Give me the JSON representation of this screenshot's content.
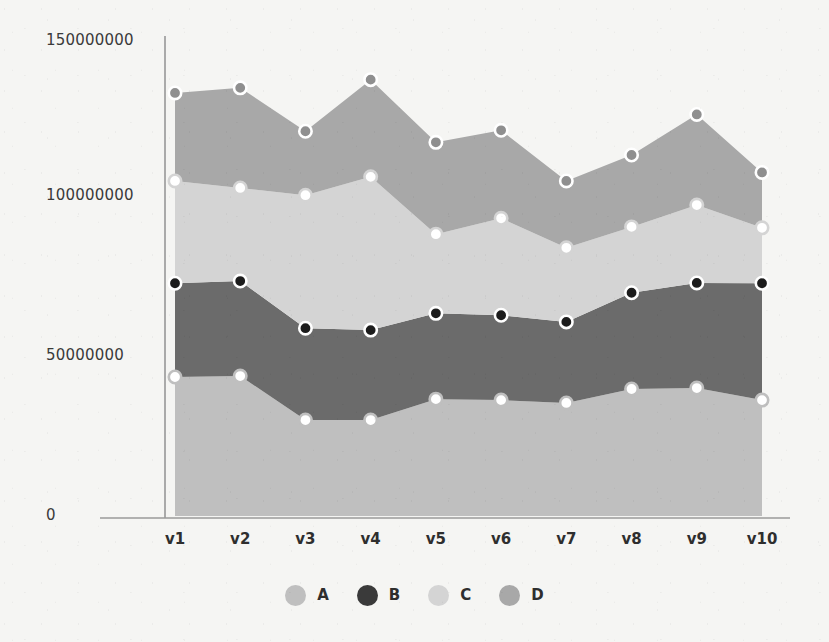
{
  "chart_data": {
    "type": "area",
    "stacked": true,
    "title": "",
    "xlabel": "",
    "ylabel": "",
    "categories": [
      "v1",
      "v2",
      "v3",
      "v4",
      "v5",
      "v6",
      "v7",
      "v8",
      "v9",
      "v10"
    ],
    "ytick_labels": [
      "0",
      "50000000",
      "100000000",
      "150000000"
    ],
    "ytick_values": [
      0,
      50000000,
      100000000,
      150000000
    ],
    "ylim": [
      0,
      150000000
    ],
    "grid": false,
    "legend_position": "bottom",
    "marker_style": "circle",
    "series": [
      {
        "name": "A",
        "color": "#bfbfbf",
        "marker_fill": "#ffffff",
        "marker_edge": "#bfbfbf",
        "stack_order": 1,
        "values": [
          43900000,
          44200000,
          30300000,
          30300000,
          36900000,
          36600000,
          35700000,
          40100000,
          40400000,
          36600000
        ],
        "cumulative_top": [
          43900000,
          44200000,
          30300000,
          30300000,
          36900000,
          36600000,
          35700000,
          40100000,
          40400000,
          36600000
        ]
      },
      {
        "name": "B",
        "color": "#6b6b6b",
        "marker_fill": "#1c1c1c",
        "marker_edge": "#ffffff",
        "stack_order": 2,
        "values": [
          29600000,
          30000000,
          29000000,
          28400000,
          27100000,
          26800000,
          25600000,
          30400000,
          33200000,
          36900000
        ],
        "cumulative_top": [
          73500000,
          74200000,
          59300000,
          58700000,
          64000000,
          63400000,
          61300000,
          70500000,
          73600000,
          73500000
        ]
      },
      {
        "name": "C",
        "color": "#d4d4d4",
        "marker_fill": "#ffffff",
        "marker_edge": "#d4d4d4",
        "stack_order": 3,
        "values": [
          32300000,
          29400000,
          42000000,
          48400000,
          25000000,
          30600000,
          23400000,
          20800000,
          24600000,
          17500000
        ],
        "cumulative_top": [
          105800000,
          103600000,
          101300000,
          107100000,
          89000000,
          94000000,
          84700000,
          91300000,
          98200000,
          91000000
        ]
      },
      {
        "name": "D",
        "color": "#a8a8a8",
        "marker_fill": "#8f8f8f",
        "marker_edge": "#ffffff",
        "stack_order": 4,
        "values": [
          27800000,
          31600000,
          20200000,
          30700000,
          29000000,
          27800000,
          21100000,
          22700000,
          28600000,
          17500000
        ],
        "cumulative_top": [
          133600000,
          135200000,
          121500000,
          137800000,
          118000000,
          121800000,
          105800000,
          114000000,
          126800000,
          108500000
        ]
      }
    ],
    "legend_entries": [
      {
        "label": "A",
        "color": "#bfbfbf"
      },
      {
        "label": "B",
        "color": "#3a3a3a"
      },
      {
        "label": "C",
        "color": "#d4d4d4"
      },
      {
        "label": "D",
        "color": "#a8a8a8"
      }
    ]
  },
  "axes": {
    "y_axis_line_color": "#8a8a8a",
    "x_axis_line_color": "#8a8a8a"
  }
}
